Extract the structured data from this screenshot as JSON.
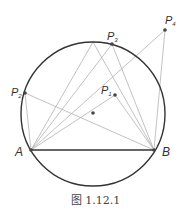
{
  "figure": {
    "caption": "图 1.12.1",
    "points": {
      "A": {
        "label": "A"
      },
      "B": {
        "label": "B"
      },
      "P1": {
        "label": "P",
        "sub": "1"
      },
      "P2": {
        "label": "P",
        "sub": "2"
      },
      "P3": {
        "label": "P",
        "sub": "3"
      },
      "P4": {
        "label": "P",
        "sub": "4"
      }
    },
    "colors": {
      "circle": "#333333",
      "chord": "#333333",
      "rays": "#b3b3b3",
      "points": "#444444"
    }
  }
}
